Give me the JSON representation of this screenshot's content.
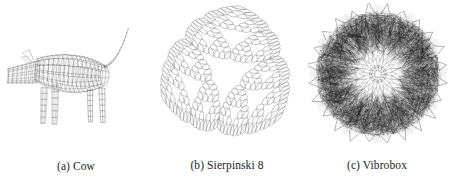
{
  "figure": {
    "background_color": "#ffffff",
    "layout": "three-subfigures-horizontal",
    "subfigures": [
      {
        "id": "cow",
        "label": "(a)",
        "name": "Cow",
        "caption": "(a) Cow",
        "kind": "wireframe-mesh-model",
        "description": "triangulated cow mesh, side view facing left, tail raised to upper right",
        "line_color": "#555555",
        "ink_color": "#3a3a3a",
        "box": {
          "x": 18,
          "y": 6,
          "width": 120,
          "height": 140
        }
      },
      {
        "id": "sierpinski",
        "label": "(b)",
        "name": "Sierpinski 8",
        "caption": "(b) Sierpinski 8",
        "kind": "fractal-outline",
        "description": "curved Sierpinski triangle of depth 8 with hollow rounded-triangular center and three crescent lobes",
        "line_color": "#8a8a8a",
        "depth": 8,
        "lobes": 3,
        "box": {
          "x": 160,
          "y": 4,
          "width": 140,
          "height": 145
        }
      },
      {
        "id": "vibrobox",
        "label": "(c)",
        "name": "Vibrobox",
        "caption": "(c) Vibrobox",
        "kind": "dense-radial-wireframe",
        "description": "dense near-black radially symmetric wireframe disc with light rosette at the center and spiky outer rim",
        "line_color": "#000000",
        "symmetry": 12,
        "box": {
          "x": 312,
          "y": 8,
          "width": 132,
          "height": 140
        }
      }
    ]
  },
  "chart_data": {
    "type": "table",
    "title": "",
    "categories": [
      "Cow",
      "Sierpinski 8",
      "Vibrobox"
    ],
    "captions": [
      "(a) Cow",
      "(b) Sierpinski 8",
      "(c) Vibrobox"
    ]
  }
}
